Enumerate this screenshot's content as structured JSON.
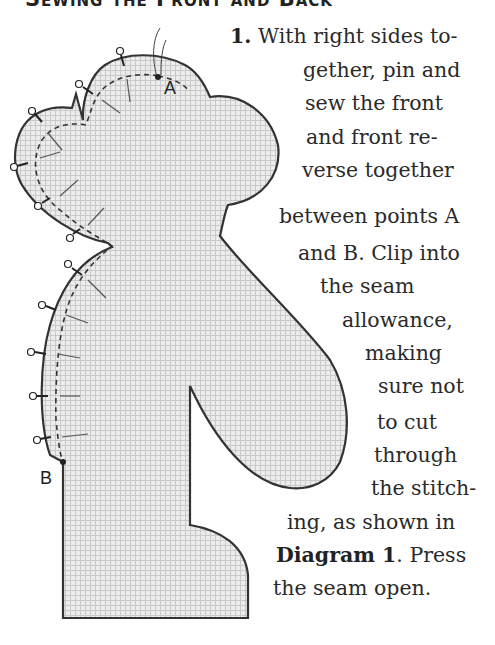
{
  "heading": "Sewing the Front and Back",
  "diagram": {
    "point_a_label": "A",
    "point_b_label": "B",
    "fill_color": "#e4e4e4",
    "outline_color": "#333333"
  },
  "instruction": {
    "step_number": "1.",
    "lines": [
      " With right sides to-",
      "gether, pin and",
      "sew the front",
      "and front re-",
      "verse together",
      "between points A",
      "and B. Clip into",
      "the seam",
      "allowance,",
      "making",
      "sure not",
      "to cut",
      "through",
      "the stitch-",
      "ing, as shown in"
    ],
    "diagram_ref": "Diagram 1",
    "after_ref": ". Press",
    "last_line": "the seam open."
  }
}
